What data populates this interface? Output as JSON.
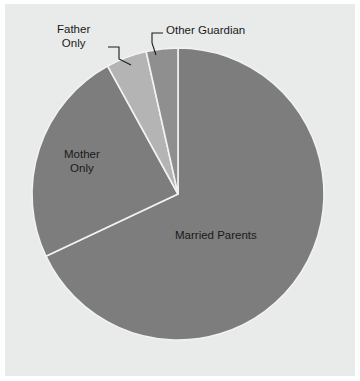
{
  "chart_data": {
    "type": "pie",
    "title": "",
    "categories": [
      "Married Parents",
      "Mother Only",
      "Father Only",
      "Other Guardian"
    ],
    "values": [
      68,
      24,
      4.5,
      3.5
    ],
    "labels": [
      "Married Parents",
      "Mother Only",
      "Father Only",
      "Other Guardian"
    ],
    "colors": [
      "#7d7d7d",
      "#7d7d7d",
      "#b4b4b4",
      "#8f8f8f"
    ],
    "slice_edge_color": "#f2f2f2",
    "background_color": "#e9eaea",
    "figure_color": "#ffffff",
    "label_color": "#1a1a1a",
    "legend": "none",
    "grid": false,
    "start_angle_deg": 90,
    "direction": "clockwise",
    "center_px": [
      178,
      194
    ],
    "radius_px": 146
  },
  "labels": {
    "married_parents": "Married Parents",
    "mother_only_line1": "Mother",
    "mother_only_line2": "Only",
    "father_only_line1": "Father",
    "father_only_line2": "Only",
    "other_guardian": "Other Guardian"
  }
}
